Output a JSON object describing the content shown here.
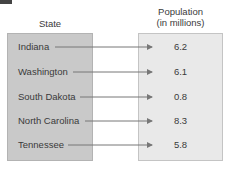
{
  "headers": {
    "left": "State",
    "right_line1": "Population",
    "right_line2": "(in millions)"
  },
  "mapping": [
    {
      "state": "Indiana",
      "population": "6.2"
    },
    {
      "state": "Washington",
      "population": "6.1"
    },
    {
      "state": "South Dakota",
      "population": "0.8"
    },
    {
      "state": "North Carolina",
      "population": "8.3"
    },
    {
      "state": "Tennessee",
      "population": "5.8"
    }
  ],
  "colors": {
    "domain_box": "#c9c9c9",
    "range_box": "#e9e9e9",
    "arrow": "#777777"
  }
}
